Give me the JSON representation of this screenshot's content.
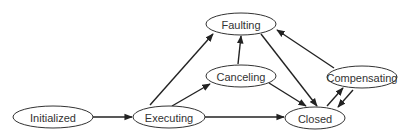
{
  "diagram": {
    "type": "state-diagram",
    "colors": {
      "stroke": "#333333",
      "background": "#ffffff",
      "text": "#333333"
    },
    "states": [
      {
        "id": "initialized",
        "label": "Initialized",
        "cx": 53,
        "cy": 117,
        "rx": 40,
        "ry": 11
      },
      {
        "id": "executing",
        "label": "Executing",
        "cx": 169,
        "cy": 117,
        "rx": 36,
        "ry": 11
      },
      {
        "id": "faulting",
        "label": "Faulting",
        "cx": 241,
        "cy": 24,
        "rx": 35,
        "ry": 11
      },
      {
        "id": "canceling",
        "label": "Canceling",
        "cx": 241,
        "cy": 76,
        "rx": 35,
        "ry": 11
      },
      {
        "id": "compensating",
        "label": "Compensating",
        "cx": 362,
        "cy": 77,
        "rx": 35,
        "ry": 11
      },
      {
        "id": "closed",
        "label": "Closed",
        "cx": 315,
        "cy": 118,
        "rx": 30,
        "ry": 11
      }
    ],
    "transitions": [
      {
        "from": "initialized",
        "to": "executing",
        "x1": 93,
        "y1": 117,
        "x2": 132,
        "y2": 117
      },
      {
        "from": "executing",
        "to": "faulting",
        "x1": 150,
        "y1": 105,
        "x2": 213,
        "y2": 34
      },
      {
        "from": "executing",
        "to": "canceling",
        "x1": 172,
        "y1": 106,
        "x2": 210,
        "y2": 84
      },
      {
        "from": "executing",
        "to": "closed",
        "x1": 205,
        "y1": 117,
        "x2": 284,
        "y2": 117
      },
      {
        "from": "canceling",
        "to": "faulting",
        "x1": 238,
        "y1": 64,
        "x2": 241,
        "y2": 36
      },
      {
        "from": "canceling",
        "to": "closed",
        "x1": 269,
        "y1": 83,
        "x2": 306,
        "y2": 106
      },
      {
        "from": "faulting",
        "to": "closed",
        "x1": 261,
        "y1": 34,
        "x2": 317,
        "y2": 106
      },
      {
        "from": "compensating",
        "to": "faulting",
        "x1": 334,
        "y1": 68,
        "x2": 277,
        "y2": 30
      },
      {
        "from": "closed",
        "to": "compensating",
        "x1": 327,
        "y1": 106,
        "x2": 343,
        "y2": 88
      },
      {
        "from": "compensating",
        "to": "closed",
        "x1": 353,
        "y1": 90,
        "x2": 338,
        "y2": 107
      }
    ]
  }
}
